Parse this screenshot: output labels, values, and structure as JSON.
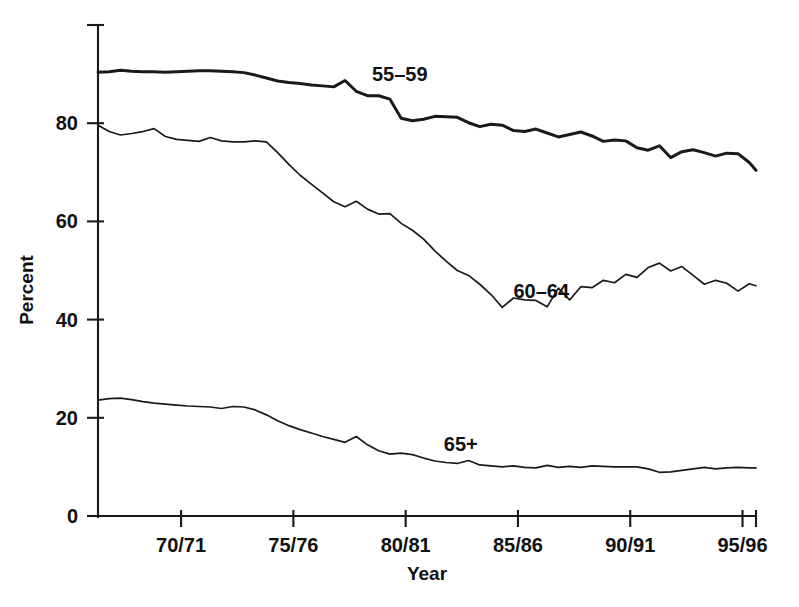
{
  "chart_data": {
    "type": "line",
    "title": "",
    "xlabel": "Year",
    "ylabel": "Percent",
    "grid": false,
    "legend_position": "inline-annotations",
    "xlim": [
      1966.3,
      1995.6
    ],
    "ylim": [
      0,
      100
    ],
    "yticks": [
      0,
      20,
      40,
      60,
      80
    ],
    "ytick_labels": [
      "0",
      "20",
      "40",
      "60",
      "80"
    ],
    "xticks": [
      1970,
      1975,
      1980,
      1985,
      1990,
      1995
    ],
    "xtick_labels": [
      "70/71",
      "75/76",
      "80/81",
      "85/86",
      "90/91",
      "95/96"
    ],
    "x": [
      1966.3,
      1966.8,
      1967.3,
      1967.8,
      1968.3,
      1968.8,
      1969.3,
      1969.8,
      1970.3,
      1970.8,
      1971.3,
      1971.8,
      1972.3,
      1972.8,
      1973.3,
      1973.8,
      1974.3,
      1974.8,
      1975.3,
      1975.8,
      1976.3,
      1976.8,
      1977.3,
      1977.8,
      1978.3,
      1978.8,
      1979.3,
      1979.8,
      1980.3,
      1980.8,
      1981.3,
      1981.8,
      1982.3,
      1982.8,
      1983.3,
      1983.8,
      1984.3,
      1984.8,
      1985.3,
      1985.8,
      1986.3,
      1986.8,
      1987.3,
      1987.8,
      1988.3,
      1988.8,
      1989.3,
      1989.8,
      1990.3,
      1990.8,
      1991.3,
      1991.8,
      1992.3,
      1992.8,
      1993.3,
      1993.8,
      1994.3,
      1994.8,
      1995.3,
      1995.6
    ],
    "series": [
      {
        "name": "55–59",
        "label": "55–59",
        "label_x": 1978.5,
        "label_y": 88.5,
        "stroke_width": 3.0,
        "values": [
          90.4,
          90.5,
          90.8,
          90.6,
          90.5,
          90.5,
          90.4,
          90.5,
          90.6,
          90.7,
          90.7,
          90.6,
          90.5,
          90.3,
          89.8,
          89.2,
          88.6,
          88.3,
          88.1,
          87.8,
          87.6,
          87.4,
          88.7,
          86.5,
          85.6,
          85.6,
          84.9,
          81.0,
          80.5,
          80.8,
          81.4,
          81.3,
          81.2,
          80.1,
          79.3,
          79.8,
          79.6,
          78.5,
          78.3,
          78.8,
          78.0,
          77.2,
          77.7,
          78.2,
          77.4,
          76.3,
          76.6,
          76.4,
          75.0,
          74.5,
          75.4,
          73.0,
          74.2,
          74.6,
          74.0,
          73.3,
          73.9,
          73.8,
          72.0,
          70.4
        ]
      },
      {
        "name": "60–64",
        "label": "60–64",
        "label_x": 1984.8,
        "label_y": 44.5,
        "stroke_width": 1.7,
        "values": [
          79.6,
          78.3,
          77.6,
          77.9,
          78.3,
          78.9,
          77.3,
          76.7,
          76.5,
          76.3,
          77.1,
          76.4,
          76.2,
          76.2,
          76.4,
          76.2,
          74.0,
          71.6,
          69.4,
          67.6,
          65.8,
          64.0,
          63.0,
          64.1,
          62.5,
          61.5,
          61.6,
          59.6,
          58.2,
          56.4,
          54.0,
          51.9,
          50.0,
          49.0,
          47.2,
          45.1,
          42.5,
          44.4,
          44.0,
          43.9,
          42.6,
          46.4,
          44.0,
          46.7,
          46.5,
          48.0,
          47.5,
          49.2,
          48.6,
          50.6,
          51.5,
          49.9,
          50.8,
          49.0,
          47.2,
          48.0,
          47.4,
          45.8,
          47.3,
          46.9
        ]
      },
      {
        "name": "65+",
        "label": "65+",
        "label_x": 1981.7,
        "label_y": 13.2,
        "stroke_width": 1.7,
        "values": [
          23.6,
          23.9,
          24.0,
          23.7,
          23.3,
          23.0,
          22.8,
          22.6,
          22.4,
          22.3,
          22.2,
          21.9,
          22.3,
          22.2,
          21.6,
          20.6,
          19.4,
          18.4,
          17.6,
          16.9,
          16.2,
          15.6,
          15.0,
          16.2,
          14.5,
          13.3,
          12.6,
          12.8,
          12.5,
          11.8,
          11.2,
          10.9,
          10.7,
          11.3,
          10.4,
          10.2,
          10.0,
          10.2,
          9.9,
          9.8,
          10.3,
          9.9,
          10.1,
          9.9,
          10.2,
          10.1,
          10.0,
          10.0,
          10.0,
          9.6,
          8.9,
          9.0,
          9.3,
          9.6,
          9.9,
          9.6,
          9.8,
          9.9,
          9.8,
          9.8
        ]
      }
    ]
  },
  "labels": {
    "y_axis_title": "Percent",
    "x_axis_title": "Year",
    "series_55_59": "55–59",
    "series_60_64": "60–64",
    "series_65_plus": "65+"
  },
  "colors": {
    "ink": "#1a1a1a",
    "background": "#ffffff"
  }
}
